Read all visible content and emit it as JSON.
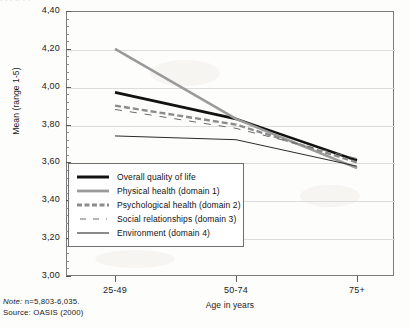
{
  "figure": {
    "top_cutoff_fragment": "  .  .  .   ..  .   .",
    "note": "Note: n=5,803-6,035.",
    "note_prefix": "Note:",
    "note_value": "n=5,803-6,035.",
    "source": "Source: OASIS (2000)"
  },
  "axes": {
    "y_title": "Mean (range 1-5)",
    "x_title": "Age in years",
    "y_ticks": [
      "4,40",
      "4,20",
      "4,00",
      "3,80",
      "3,60",
      "3,40",
      "3,20",
      "3,00"
    ],
    "y_tick_values": [
      4.4,
      4.2,
      4.0,
      3.8,
      3.6,
      3.4,
      3.2,
      3.0
    ],
    "x_ticks": [
      "25-49",
      "50-74",
      "75+"
    ]
  },
  "chart_data": {
    "type": "line",
    "title": "",
    "xlabel": "Age in years",
    "ylabel": "Mean (range 1-5)",
    "categories": [
      "25-49",
      "50-74",
      "75+"
    ],
    "ylim": [
      3.0,
      4.4
    ],
    "ytick_step": 0.2,
    "grid": true,
    "legend_position": "inside-lower-left",
    "decimal_separator": ",",
    "series": [
      {
        "name": "Overall quality of life",
        "values": [
          3.97,
          3.83,
          3.61
        ],
        "style": "solid",
        "color": "#121212",
        "width": 2.6
      },
      {
        "name": "Physical health (domain 1)",
        "values": [
          4.2,
          3.83,
          3.57
        ],
        "style": "solid",
        "color": "#9a9a9a",
        "width": 2.6
      },
      {
        "name": "Psychological health (domain 2)",
        "values": [
          3.9,
          3.8,
          3.6
        ],
        "style": "dashed-thick",
        "color": "#8c8c8c",
        "width": 2.4
      },
      {
        "name": "Social relationships (domain 3)",
        "values": [
          3.88,
          3.78,
          3.62
        ],
        "style": "dashed-thin",
        "color": "#6b6b6b",
        "width": 1.0
      },
      {
        "name": "Environment (domain 4)",
        "values": [
          3.74,
          3.72,
          3.58
        ],
        "style": "solid",
        "color": "#2a2a2a",
        "width": 1.0
      }
    ]
  },
  "legend": {
    "items": [
      {
        "label": "Overall quality of life"
      },
      {
        "label": "Physical health (domain 1)"
      },
      {
        "label": "Psychological health (domain 2)"
      },
      {
        "label": "Social relationships (domain 3)"
      },
      {
        "label": "Environment (domain 4)"
      }
    ]
  }
}
